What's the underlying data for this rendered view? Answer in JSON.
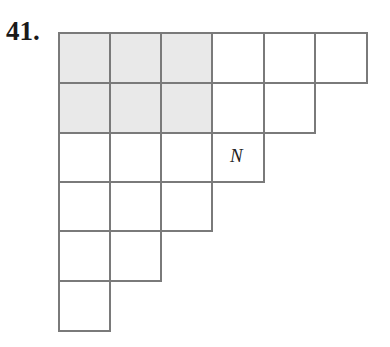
{
  "problem": {
    "number": "41."
  },
  "grid": {
    "row_lengths": [
      6,
      5,
      4,
      3,
      2,
      1
    ],
    "shaded": {
      "rows": [
        0,
        1
      ],
      "cols": [
        0,
        1,
        2
      ]
    },
    "label": {
      "text": "N",
      "row": 2,
      "col": 3
    },
    "colors": {
      "line": "#7a7a7a",
      "shaded": "#e9e9e9",
      "background": "#ffffff"
    }
  }
}
